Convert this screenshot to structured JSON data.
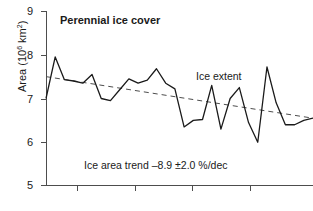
{
  "chart_data": {
    "type": "line",
    "title": "Perennial ice cover",
    "xlabel": "",
    "ylabel": "Area (10⁶ km²)",
    "ylabel_base": "Area (10",
    "ylabel_exp": "6",
    "ylabel_tail": " km",
    "ylabel_exp2": "2",
    "ylabel_close": ")",
    "ylim": [
      5,
      9
    ],
    "yticks": [
      9,
      8,
      7,
      6,
      5
    ],
    "ytick_labels": [
      "9",
      "8",
      "7",
      "6",
      "5"
    ],
    "xlim": [
      0,
      29
    ],
    "xticks": [
      5,
      11,
      17,
      23
    ],
    "xtick_labels": [
      "",
      "",
      "",
      ""
    ],
    "grid": false,
    "legend_position": "none",
    "annotations": [
      {
        "name": "ice-extent",
        "text": "Ice extent",
        "x": 17.5,
        "y": 7.55
      },
      {
        "name": "ice-area-trend",
        "text": "Ice area trend –8.9 ±2.0 %/dec",
        "x": 4.5,
        "y": 5.45
      }
    ],
    "series": [
      {
        "name": "Ice extent",
        "style": "solid",
        "color": "#1a1a1a",
        "x": [
          0,
          1,
          2,
          3,
          4,
          5,
          6,
          7,
          8,
          9,
          10,
          11,
          12,
          13,
          14,
          15,
          16,
          17,
          18,
          19,
          20,
          21,
          22,
          23,
          24,
          25,
          26,
          27,
          28,
          29
        ],
        "values": [
          7.0,
          7.95,
          7.43,
          7.4,
          7.35,
          7.55,
          7.0,
          6.95,
          7.2,
          7.45,
          7.35,
          7.42,
          7.68,
          7.35,
          7.22,
          6.35,
          6.5,
          6.52,
          7.3,
          6.3,
          7.0,
          7.25,
          6.45,
          6.0,
          7.72,
          6.9,
          6.4,
          6.4,
          6.5,
          6.55
        ]
      },
      {
        "name": "Linear trend",
        "style": "dashed",
        "color": "#4d4d4d",
        "x": [
          0,
          29
        ],
        "values": [
          7.5,
          6.55
        ]
      }
    ],
    "trend_rate": "–8.9 ±2.0 %/dec"
  }
}
